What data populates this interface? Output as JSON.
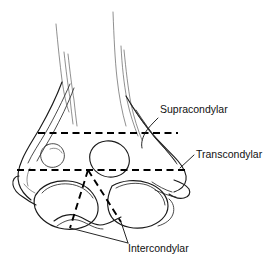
{
  "figure": {
    "background_color": "#ffffff",
    "line_color": "#1a1a1a",
    "dash_color": "#000000",
    "width": 277,
    "height": 265
  },
  "labels": {
    "supracondylar": "Supracondylar",
    "transcondylar": "Transcondylar",
    "intercondylar": "Intercondylar"
  },
  "fracture_lines": [
    {
      "name": "supracondylar",
      "label": "Supracondylar",
      "style": "dashed",
      "orientation": "horizontal",
      "y": 133
    },
    {
      "name": "transcondylar",
      "label": "Transcondylar",
      "style": "dashed",
      "orientation": "horizontal",
      "y": 170
    },
    {
      "name": "intercondylar",
      "label": "Intercondylar",
      "style": "dashed",
      "orientation": "v-shaped",
      "apex_y": 170
    }
  ],
  "anatomy_parts": [
    "humeral-shaft",
    "medial-epicondyle",
    "lateral-epicondyle",
    "olecranon-fossa",
    "trochlea",
    "capitulum"
  ]
}
